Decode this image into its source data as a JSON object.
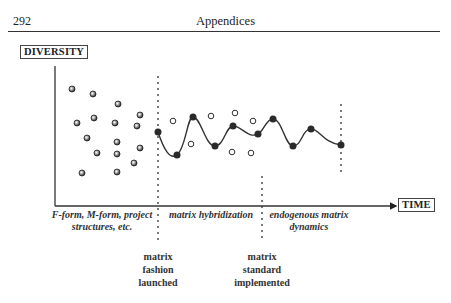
{
  "header": {
    "page_number": "292",
    "running_title": "Appendices"
  },
  "figure": {
    "y_axis_label": "DIVERSITY",
    "x_axis_label": "TIME",
    "phases": [
      {
        "line1": "F-form, M-form, project",
        "line2": "structures, etc."
      },
      {
        "line1": "matrix hybridization",
        "line2": ""
      },
      {
        "line1": "endogenous matrix",
        "line2": "dynamics"
      }
    ],
    "events": [
      {
        "line1": "matrix",
        "line2": "fashion",
        "line3": "launched"
      },
      {
        "line1": "matrix",
        "line2": "standard",
        "line3": "implemented"
      }
    ],
    "colors": {
      "ink": "#222222",
      "dot": "#2a2a2a"
    }
  }
}
